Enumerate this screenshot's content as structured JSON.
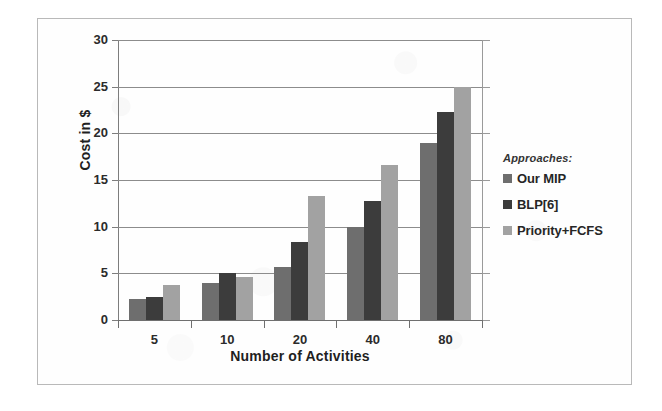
{
  "figure": {
    "frame_border_color": "#b9b9b9",
    "background_color": "#fefefe"
  },
  "chart_data": {
    "type": "bar",
    "title": "",
    "subtitle": "",
    "xlabel": "Number of Activities",
    "ylabel": "Cost in $",
    "categories": [
      "5",
      "10",
      "20",
      "40",
      "80"
    ],
    "series": [
      {
        "name": "Our MIP",
        "color": "#6e6e6e",
        "values": [
          2.2,
          4.0,
          5.7,
          10.0,
          19.0
        ]
      },
      {
        "name": "BLP[6]",
        "color": "#3c3c3c",
        "values": [
          2.5,
          5.0,
          8.4,
          12.8,
          22.3
        ]
      },
      {
        "name": "Priority+FCFS",
        "color": "#a2a2a2",
        "values": [
          3.7,
          4.6,
          13.3,
          16.6,
          25.0
        ]
      }
    ],
    "ylim": [
      0,
      30
    ],
    "yticks": [
      0,
      5,
      10,
      15,
      20,
      25,
      30
    ],
    "ytick_labels": [
      "0",
      "5",
      "10",
      "15",
      "20",
      "25",
      "30"
    ],
    "grid": "horizontal",
    "legend_position": "right-outside",
    "legend_title": "Approaches:"
  }
}
